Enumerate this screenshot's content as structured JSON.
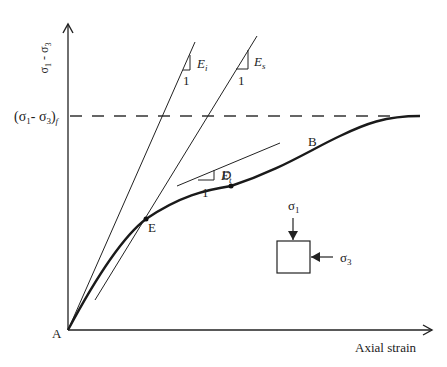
{
  "diagram": {
    "y_axis_label": "σ1 - σ3",
    "x_axis_label": "Axial strain",
    "failure_label": "(σ1- σ3)",
    "failure_subscript": "f",
    "points": {
      "origin": "A",
      "curve_end": "B",
      "tangent_point": "D",
      "intersection_point": "E"
    },
    "moduli": {
      "initial": {
        "symbol": "E",
        "subscript": "i",
        "run_label": "1"
      },
      "secant": {
        "symbol": "E",
        "subscript": "s",
        "run_label": "1"
      },
      "tangent": {
        "symbol": "E",
        "subscript": "t",
        "run_label": "1"
      }
    },
    "stress_element": {
      "sigma1": "σ",
      "sigma1_sub": "1",
      "sigma3": "σ",
      "sigma3_sub": "3"
    },
    "colors": {
      "line": "#222222",
      "curve": "#1a1a1a"
    }
  }
}
